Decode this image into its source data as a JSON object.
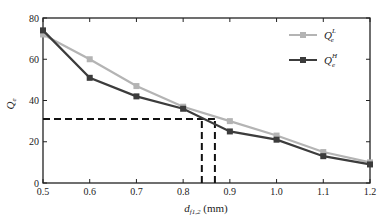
{
  "chart_data": {
    "type": "line",
    "title": "",
    "xlabel": "d_{f1,2} (mm)",
    "xlabel_main": "d",
    "xlabel_sub": "f1,2",
    "xlabel_unit": " (mm)",
    "ylabel": "Q_e",
    "ylabel_main": "Q",
    "ylabel_sub": "e",
    "xlim": [
      0.5,
      1.2
    ],
    "ylim": [
      0,
      80
    ],
    "x_ticks": [
      0.5,
      0.6,
      0.7,
      0.8,
      0.9,
      1.0,
      1.1,
      1.2
    ],
    "x_tick_labels": [
      "0.5",
      "0.6",
      "0.7",
      "0.8",
      "0.9",
      "1.0",
      "1.1",
      "1.2"
    ],
    "y_ticks": [
      0,
      20,
      40,
      60,
      80
    ],
    "y_tick_labels": [
      "0",
      "20",
      "40",
      "60",
      "80"
    ],
    "grid": false,
    "legend_position": "upper right",
    "x": [
      0.5,
      0.6,
      0.7,
      0.8,
      0.9,
      1.0,
      1.1,
      1.2
    ],
    "series": [
      {
        "name": "Q_e^L",
        "label_main": "Q",
        "label_sub": "e",
        "label_sup": "L",
        "color": "#b4b4b4",
        "marker": "square",
        "values": [
          72,
          60,
          47,
          37,
          30,
          23,
          15,
          10
        ]
      },
      {
        "name": "Q_e^H",
        "label_main": "Q",
        "label_sub": "e",
        "label_sup": "H",
        "color": "#3c3c3c",
        "marker": "square",
        "values": [
          74,
          51,
          42,
          36,
          25,
          21,
          13,
          9
        ]
      }
    ],
    "annotations": [
      {
        "type": "hline-dashed",
        "y": 31,
        "x_from": 0.5,
        "x_to": 0.868
      },
      {
        "type": "vline-dashed",
        "x": 0.84,
        "y_from": 0,
        "y_to": 31
      },
      {
        "type": "vline-dashed",
        "x": 0.868,
        "y_from": 0,
        "y_to": 31
      }
    ]
  }
}
